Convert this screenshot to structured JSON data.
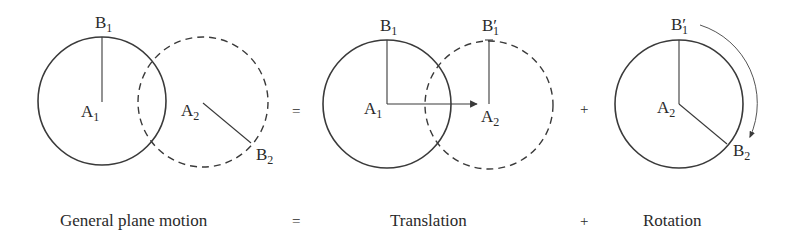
{
  "figure": {
    "panels": [
      {
        "id": "general-plane-motion",
        "caption": "General plane motion",
        "labels": {
          "b1": {
            "main": "B",
            "sub": "1"
          },
          "a1": {
            "main": "A",
            "sub": "1"
          },
          "a2": {
            "main": "A",
            "sub": "2"
          },
          "b2": {
            "main": "B",
            "sub": "2"
          }
        }
      },
      {
        "id": "translation",
        "caption": "Translation",
        "labels": {
          "b1": {
            "main": "B",
            "sub": "1"
          },
          "b1p": {
            "main": "B′",
            "sub": "1"
          },
          "a1": {
            "main": "A",
            "sub": "1"
          },
          "a2": {
            "main": "A",
            "sub": "2"
          }
        }
      },
      {
        "id": "rotation",
        "caption": "Rotation",
        "labels": {
          "b1p": {
            "main": "B′",
            "sub": "1"
          },
          "a2": {
            "main": "A",
            "sub": "2"
          },
          "b2": {
            "main": "B",
            "sub": "2"
          }
        }
      }
    ],
    "operators": {
      "equals": "=",
      "plus": "+"
    },
    "colors": {
      "stroke": "#3a3a3a",
      "text": "#2a2a2a",
      "background": "#ffffff"
    }
  }
}
